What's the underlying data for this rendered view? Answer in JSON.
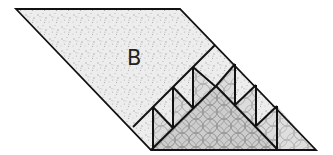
{
  "figure": {
    "label": "B",
    "colors": {
      "background": "#ffffff",
      "outline": "#111111",
      "speckle_fill": "#ececec",
      "speckle_dots": "#a8a8a8",
      "small_triangle_fill": "#d4d4d4",
      "big_triangle_fill": "#c4c4c4",
      "circle_pattern": "#8a8a8a"
    },
    "regions": [
      {
        "name": "region-B",
        "fill": "speckled",
        "label": "B"
      },
      {
        "name": "staircase-band",
        "fill": "speckled",
        "note": "row of small light triangles"
      },
      {
        "name": "small-triangles",
        "fill": "circle-patterned",
        "count": 7
      },
      {
        "name": "central-triangle",
        "fill": "circle-patterned"
      }
    ]
  }
}
